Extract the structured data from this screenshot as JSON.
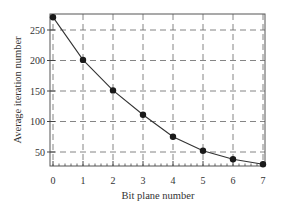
{
  "chart_data": {
    "type": "line",
    "title": "",
    "xlabel": "Bit plane number",
    "ylabel": "Average iteration number",
    "x": [
      0,
      1,
      2,
      3,
      4,
      5,
      6,
      7
    ],
    "series": [
      {
        "name": "Average iteration number",
        "values": [
          271,
          201,
          151,
          111,
          75,
          52,
          38,
          30
        ]
      }
    ],
    "xlim": [
      0,
      7
    ],
    "ylim": [
      25,
      275
    ],
    "xticks": [
      0,
      1,
      2,
      3,
      4,
      5,
      6,
      7
    ],
    "yticks": [
      50,
      100,
      150,
      200,
      250
    ],
    "grid": true,
    "grid_style": "dashed",
    "legend": null,
    "marker": "filled-circle",
    "line_color": "#333333"
  },
  "labels": {
    "xlabel": "Bit plane number",
    "ylabel": "Average iteration number"
  }
}
